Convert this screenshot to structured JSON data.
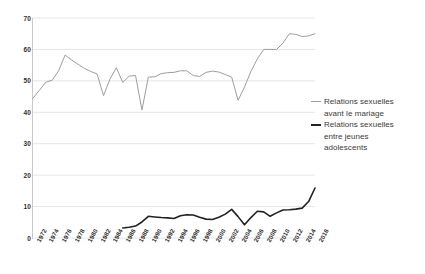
{
  "chart_data": {
    "type": "line",
    "title": "",
    "subtitle": "",
    "xlabel": "",
    "ylabel": "",
    "ylim": [
      0,
      70
    ],
    "y_ticks": [
      0,
      10,
      20,
      30,
      40,
      50,
      60,
      70
    ],
    "grid": true,
    "legend_position": "right",
    "x": [
      1972,
      1973,
      1974,
      1975,
      1976,
      1977,
      1978,
      1979,
      1980,
      1981,
      1982,
      1983,
      1984,
      1985,
      1986,
      1987,
      1988,
      1989,
      1990,
      1991,
      1992,
      1993,
      1994,
      1995,
      1996,
      1997,
      1998,
      1999,
      2000,
      2001,
      2002,
      2003,
      2004,
      2005,
      2006,
      2007,
      2008,
      2009,
      2010,
      2011,
      2012,
      2013,
      2014,
      2015,
      2016
    ],
    "categories": [
      "1972",
      "1974",
      "1976",
      "1978",
      "1980",
      "1982",
      "1984",
      "1986",
      "1988",
      "1990",
      "1992",
      "1994",
      "1996",
      "1998",
      "2000",
      "2002",
      "2004",
      "2006",
      "2008",
      "2010",
      "2012",
      "2014",
      "2016"
    ],
    "series": [
      {
        "name": "Relations sexuelles avant le mariage",
        "color": "#9e9e9e",
        "width": 1,
        "x": [
          1972,
          1973,
          1974,
          1975,
          1976,
          1977,
          1978,
          1979,
          1980,
          1981,
          1982,
          1983,
          1984,
          1985,
          1986,
          1987,
          1988,
          1989,
          1990,
          1991,
          1992,
          1993,
          1994,
          1995,
          1996,
          1997,
          1998,
          1999,
          2000,
          2001,
          2002,
          2003,
          2004,
          2005,
          2006,
          2007,
          2008,
          2009,
          2010,
          2011,
          2012,
          2013,
          2014,
          2015,
          2016
        ],
        "values": [
          44.5,
          47.0,
          49.6,
          50.2,
          53.2,
          58.2,
          56.7,
          55.3,
          54.0,
          53.0,
          52.2,
          45.3,
          50.5,
          54.2,
          49.5,
          51.5,
          51.7,
          40.7,
          51.2,
          51.3,
          52.3,
          52.6,
          52.7,
          53.2,
          53.2,
          51.7,
          51.4,
          52.7,
          53.1,
          52.8,
          52.0,
          51.2,
          43.8,
          48.0,
          53.0,
          57.0,
          60.0,
          60.0,
          60.0,
          62.0,
          65.0,
          64.8,
          64.1,
          64.3,
          65.0
        ]
      },
      {
        "name": "Relations sexuelles entre jeunes adolescents",
        "color": "#222222",
        "width": 1.6,
        "x": [
          1986,
          1987,
          1988,
          1989,
          1990,
          1991,
          1992,
          1993,
          1994,
          1995,
          1996,
          1997,
          1998,
          1999,
          2000,
          2001,
          2002,
          2003,
          2004,
          2005,
          2006,
          2007,
          2008,
          2009,
          2010,
          2011,
          2012,
          2013,
          2014,
          2015,
          2016
        ],
        "values": [
          3.2,
          3.4,
          3.8,
          5.1,
          6.9,
          6.7,
          6.5,
          6.4,
          6.2,
          7.1,
          7.4,
          7.3,
          6.6,
          6.0,
          5.9,
          6.6,
          7.6,
          9.1,
          6.8,
          4.2,
          6.5,
          8.5,
          8.3,
          6.9,
          8.0,
          8.9,
          9.0,
          9.2,
          9.5,
          11.6,
          15.9
        ]
      }
    ]
  },
  "legend": {
    "entries": [
      {
        "line1": "Relations sexuelles",
        "line2": "avant le mariage",
        "swatch": "thin-gray-line-icon"
      },
      {
        "line1": "Relations sexuelles",
        "line2": "entre jeunes",
        "line3": "adolescents",
        "swatch": "thick-black-line-icon"
      }
    ]
  },
  "axis": {
    "y_labels": [
      "70",
      "60",
      "50",
      "40",
      "30",
      "20",
      "10",
      "0"
    ],
    "x_labels": [
      "1972",
      "1974",
      "1976",
      "1978",
      "1980",
      "1982",
      "1984",
      "1986",
      "1988",
      "1990",
      "1992",
      "1994",
      "1996",
      "1998",
      "2000",
      "2002",
      "2004",
      "2006",
      "2008",
      "2010",
      "2012",
      "2014",
      "2016"
    ]
  },
  "colors": {
    "grid": "#e6e6e6",
    "axis": "#c9c9c9",
    "series_gray": "#9e9e9e",
    "series_black": "#222222",
    "text": "#2f2f2f",
    "background": "#ffffff"
  }
}
